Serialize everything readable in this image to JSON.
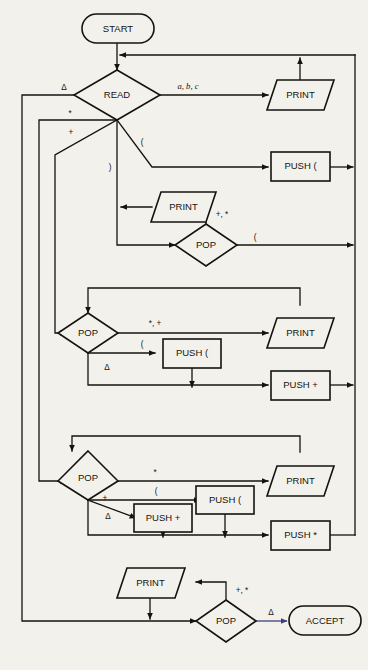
{
  "diagram": {
    "colors": {
      "background": "#f3f1ec",
      "stroke": "#15130f",
      "accept_arrow": "#3f3f7a"
    },
    "nodes": {
      "start": {
        "label": "START",
        "shape": "terminator"
      },
      "read": {
        "label": "READ",
        "shape": "decision"
      },
      "print1": {
        "label": "PRINT",
        "shape": "io"
      },
      "push_paren1": {
        "label": "PUSH (",
        "shape": "process"
      },
      "print2": {
        "label": "PRINT",
        "shape": "io"
      },
      "pop2": {
        "label": "POP",
        "shape": "decision"
      },
      "pop3": {
        "label": "POP",
        "shape": "decision"
      },
      "print3": {
        "label": "PRINT",
        "shape": "io"
      },
      "push_paren3": {
        "label": "PUSH (",
        "shape": "process"
      },
      "push_plus3": {
        "label": "PUSH +",
        "shape": "process"
      },
      "pop4": {
        "label": "POP",
        "shape": "decision"
      },
      "print4": {
        "label": "PRINT",
        "shape": "io"
      },
      "push_paren4": {
        "label": "PUSH (",
        "shape": "process"
      },
      "push_plus4": {
        "label": "PUSH +",
        "shape": "process"
      },
      "push_star4": {
        "label": "PUSH *",
        "shape": "process"
      },
      "print5": {
        "label": "PRINT",
        "shape": "io"
      },
      "pop5": {
        "label": "POP",
        "shape": "decision"
      },
      "accept": {
        "label": "ACCEPT",
        "shape": "terminator"
      }
    },
    "edge_labels": {
      "read_delta": "Δ",
      "read_abc": "a, b, c",
      "read_star": "*",
      "read_plus": "+",
      "read_open": "(",
      "read_close": ")",
      "pop2_plus_star": "+, *",
      "pop2_open": "(",
      "pop3_star_plus": "*, +",
      "pop3_open": "(",
      "pop3_delta": "Δ",
      "pop4_star": "*",
      "pop4_open": "(",
      "pop4_plus": "+",
      "pop4_delta": "Δ",
      "pop5_plus_star": "+, *",
      "pop5_delta": "Δ"
    }
  }
}
